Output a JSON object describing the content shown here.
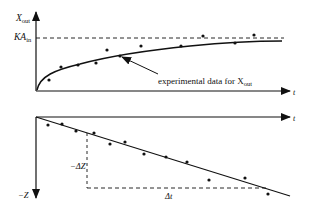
{
  "top_chart": {
    "y_axis_label": "X",
    "y_axis_label_sub": "out",
    "asymptote_label": "KA",
    "asymptote_label_sub": "in",
    "x_axis_label": "t",
    "annotation": "experimental data for X",
    "annotation_sub": "out",
    "points": [
      [
        47,
        80
      ],
      [
        61,
        67
      ],
      [
        78,
        65
      ],
      [
        96,
        63
      ],
      [
        107,
        50
      ],
      [
        120,
        56
      ],
      [
        141,
        46
      ],
      [
        181,
        45
      ],
      [
        203,
        47
      ],
      [
        218,
        38
      ],
      [
        236,
        43
      ],
      [
        254,
        36
      ]
    ]
  },
  "bottom_chart": {
    "y_axis_label": "−Z",
    "x_axis_label": "t",
    "delta_z_label": "−ΔZ",
    "delta_t_label": "Δt",
    "points": [
      [
        48,
        125
      ],
      [
        62,
        127
      ],
      [
        76,
        132
      ],
      [
        94,
        134
      ],
      [
        110,
        144
      ],
      [
        125,
        143
      ],
      [
        144,
        154
      ],
      [
        166,
        157
      ],
      [
        187,
        165
      ],
      [
        209,
        167
      ],
      [
        226,
        180
      ],
      [
        246,
        178
      ],
      [
        268,
        194
      ]
    ]
  },
  "colors": {
    "ink": "#111111",
    "background": "#ffffff"
  }
}
